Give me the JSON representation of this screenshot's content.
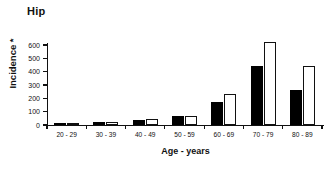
{
  "chart_data": {
    "type": "bar",
    "title": "Hip",
    "xlabel": "Age - years",
    "ylabel": "Incidence *",
    "categories": [
      "20 - 29",
      "30 - 39",
      "40 - 49",
      "50 - 59",
      "60 - 69",
      "70 - 79",
      "80 - 89"
    ],
    "series": [
      {
        "name": "series-solid",
        "color": "#000000",
        "style": "filled",
        "values": [
          10,
          25,
          40,
          65,
          175,
          440,
          260
        ]
      },
      {
        "name": "series-hollow",
        "color": "#ffffff",
        "style": "open",
        "values": [
          10,
          25,
          42,
          65,
          235,
          620,
          440
        ]
      }
    ],
    "ylim": [
      0,
      600
    ],
    "yticks": [
      0,
      100,
      200,
      300,
      400,
      500,
      600
    ],
    "ytick_labels": [
      "0",
      "100",
      "200",
      "300",
      "400",
      "500",
      "600"
    ],
    "grid": false,
    "legend": "none"
  }
}
